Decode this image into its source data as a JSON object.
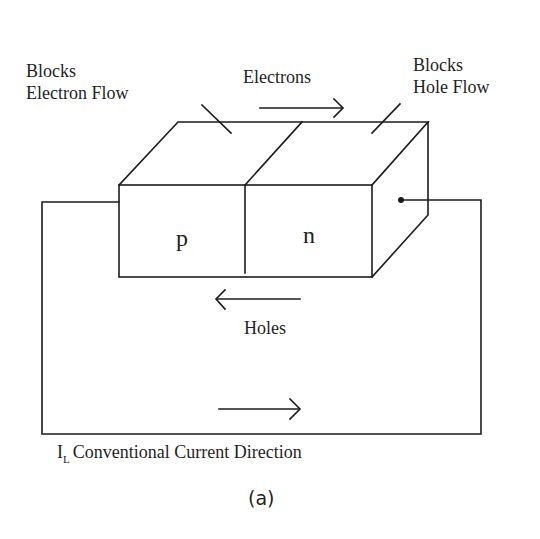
{
  "labels": {
    "blocks_electron_flow": {
      "line1": "Blocks",
      "line2": "Electron Flow"
    },
    "blocks_hole_flow": {
      "line1": "Blocks",
      "line2": "Hole Flow"
    },
    "electrons": "Electrons",
    "holes": "Holes",
    "p_region": "p",
    "n_region": "n",
    "current": {
      "symbol": "I",
      "subscript": "L",
      "text": "Conventional Current Direction"
    },
    "caption": "(a)"
  },
  "colors": {
    "line": "#1c1c1c",
    "background": "#ffffff"
  },
  "arrows": {
    "electrons": "right",
    "holes": "left",
    "current": "right"
  }
}
